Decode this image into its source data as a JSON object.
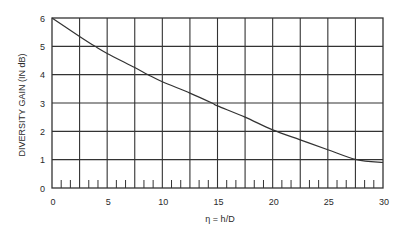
{
  "chart_data": {
    "type": "line",
    "title": "",
    "xlabel": "η = h/D",
    "ylabel": "DIVERSITY GAIN (IN dB)",
    "xlim": [
      0,
      30
    ],
    "ylim": [
      0,
      6
    ],
    "x_ticks": [
      0,
      5,
      10,
      15,
      20,
      25,
      30
    ],
    "x_tick_labels": [
      "0",
      "5",
      "10",
      "15",
      "20",
      "25",
      "30"
    ],
    "x_gridlines": [
      2.5,
      5,
      7.5,
      10,
      12.5,
      15,
      17.5,
      20,
      22.5,
      25,
      27.5
    ],
    "x_minor_ticks_per_grid_interval": 2,
    "y_ticks": [
      0,
      1,
      2,
      3,
      4,
      5,
      6
    ],
    "y_tick_labels": [
      "0",
      "1",
      "2",
      "3",
      "4",
      "5",
      "6"
    ],
    "grid": true,
    "legend": null,
    "series": [
      {
        "name": "Diversity gain",
        "x": [
          0,
          2.5,
          3.9,
          5,
          7.5,
          8.7,
          10,
          12.5,
          14.5,
          15,
          17.5,
          20,
          22.5,
          25,
          27.6,
          30
        ],
        "y": [
          6.0,
          5.35,
          5.0,
          4.75,
          4.25,
          4.0,
          3.75,
          3.35,
          3.0,
          2.9,
          2.5,
          2.05,
          1.7,
          1.35,
          1.0,
          0.9
        ]
      }
    ]
  }
}
